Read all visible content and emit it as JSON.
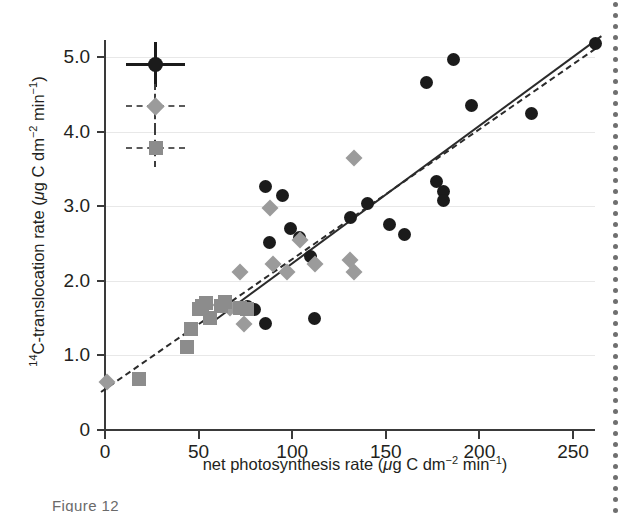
{
  "figure": {
    "caption_partial": "Figure 12",
    "edge_rule": "dotted-page-rule"
  },
  "chart_data": {
    "type": "scatter",
    "title": "",
    "xlabel": "net photosynthesis rate (μg C dm−2 min−1)",
    "ylabel": "14C-translocation rate (μg C dm−2 min−1)",
    "xlabel_parts": {
      "text": "net photosynthesis rate",
      "unit_open": "(",
      "mu": "μ",
      "g_c_dm": "g C dm",
      "exp1": "−2",
      "min": "min",
      "exp2": "−1",
      "unit_close": ")"
    },
    "ylabel_parts": {
      "pre_sup": "14",
      "text": "C-translocation rate",
      "unit_open": "(",
      "mu": "μ",
      "g_c_dm": "g C dm",
      "exp1": "−2",
      "min": "min",
      "exp2": "−1",
      "unit_close": ")"
    },
    "xlim": [
      0,
      262
    ],
    "ylim": [
      0,
      5.35
    ],
    "xticks": [
      0,
      50,
      100,
      150,
      200,
      250
    ],
    "xticklabels": [
      "0",
      "50",
      "100",
      "150",
      "200",
      "250"
    ],
    "yticks": [
      0,
      1.0,
      2.0,
      3.0,
      4.0,
      5.0
    ],
    "yticklabels": [
      "0",
      "1.0",
      "2.0",
      "3.0",
      "4.0",
      "5.0"
    ],
    "grid": "horizontal",
    "legend_position": "upper-left-inset-errorbars",
    "colors": {
      "circle": "#1b1b1b",
      "diamond": "#9b9b9b",
      "square": "#8c8c8c",
      "line": "#2b2b2b",
      "grid": "#e8e8e8",
      "axis": "#3a3a3a",
      "text": "#231f20"
    },
    "series": [
      {
        "name": "circles",
        "marker": "circle",
        "color": "#1b1b1b",
        "points": [
          [
            86,
            3.26
          ],
          [
            95,
            3.14
          ],
          [
            99,
            2.7
          ],
          [
            88,
            2.52
          ],
          [
            104,
            2.58
          ],
          [
            110,
            2.32
          ],
          [
            76,
            1.65
          ],
          [
            80,
            1.62
          ],
          [
            86,
            1.43
          ],
          [
            112,
            1.5
          ],
          [
            131,
            2.85
          ],
          [
            140,
            3.03
          ],
          [
            152,
            2.75
          ],
          [
            160,
            2.62
          ],
          [
            172,
            4.66
          ],
          [
            177,
            3.33
          ],
          [
            186,
            4.97
          ],
          [
            181,
            3.2
          ],
          [
            181,
            3.07
          ],
          [
            196,
            4.35
          ],
          [
            228,
            4.24
          ],
          [
            262,
            5.18
          ]
        ]
      },
      {
        "name": "diamonds",
        "marker": "diamond",
        "color": "#9b9b9b",
        "points": [
          [
            1,
            0.65
          ],
          [
            62,
            1.68
          ],
          [
            67,
            1.63
          ],
          [
            72,
            2.12
          ],
          [
            74,
            1.42
          ],
          [
            88,
            2.98
          ],
          [
            90,
            2.22
          ],
          [
            97,
            2.12
          ],
          [
            104,
            2.55
          ],
          [
            112,
            2.22
          ],
          [
            133,
            3.65
          ],
          [
            131,
            2.28
          ],
          [
            133,
            2.12
          ]
        ]
      },
      {
        "name": "squares",
        "marker": "square",
        "color": "#8c8c8c",
        "points": [
          [
            18,
            0.68
          ],
          [
            44,
            1.11
          ],
          [
            46,
            1.36
          ],
          [
            50,
            1.62
          ],
          [
            52,
            1.66
          ],
          [
            54,
            1.7
          ],
          [
            56,
            1.5
          ],
          [
            62,
            1.66
          ],
          [
            64,
            1.72
          ],
          [
            72,
            1.64
          ],
          [
            76,
            1.62
          ]
        ]
      }
    ],
    "fit_lines": [
      {
        "name": "solid-fit",
        "style": "solid",
        "x0": 58,
        "y0": 1.48,
        "x1": 265,
        "y1": 5.3
      },
      {
        "name": "dashed-fit",
        "style": "dashed",
        "x0": -2,
        "y0": 0.52,
        "x1": 262,
        "y1": 5.12
      }
    ],
    "error_bar_key": [
      {
        "name": "circle-key",
        "marker": "circle",
        "style": "solid",
        "x": 27,
        "y": 4.9,
        "x_err": 16,
        "y_err": 0.3
      },
      {
        "name": "diamond-key",
        "marker": "diamond",
        "style": "dashed",
        "x": 27,
        "y": 4.34,
        "x_err": 16,
        "y_err": 0.3
      },
      {
        "name": "square-key",
        "marker": "square",
        "style": "dashed",
        "x": 27,
        "y": 3.78,
        "x_err": 16,
        "y_err": 0.25
      }
    ]
  }
}
